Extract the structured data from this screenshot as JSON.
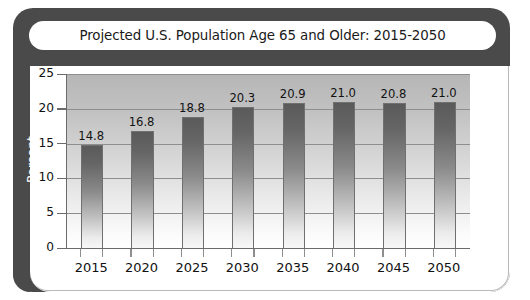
{
  "chart_data": {
    "type": "bar",
    "title": "Projected U.S. Population Age 65 and Older: 2015-2050",
    "xlabel": "",
    "ylabel": "Percent",
    "categories": [
      "2015",
      "2020",
      "2025",
      "2030",
      "2035",
      "2040",
      "2045",
      "2050"
    ],
    "values": [
      14.8,
      16.8,
      18.8,
      20.3,
      20.9,
      21.0,
      20.8,
      21.0
    ],
    "value_labels": [
      "14.8",
      "16.8",
      "18.8",
      "20.3",
      "20.9",
      "21.0",
      "20.8",
      "21.0"
    ],
    "ylim": [
      0,
      25
    ],
    "yticks": [
      0,
      5,
      10,
      15,
      20,
      25
    ],
    "ytick_labels": [
      "0",
      "5",
      "10",
      "15",
      "20",
      "25"
    ],
    "grid": true,
    "legend": null,
    "colors": {
      "frame": "#4a4a4a",
      "bar_top": "#5a5a5a",
      "bar_bottom": "#f7f7f7",
      "plot_top": "#b6b6b6",
      "plot_bottom": "#ffffff",
      "axis": "#6b6b6b",
      "gridline": "#8e8e8e",
      "text": "#111111",
      "title_text": "#1a1a1a",
      "ylabel_text": "#ffffff",
      "page_background": "#ffffff"
    }
  }
}
